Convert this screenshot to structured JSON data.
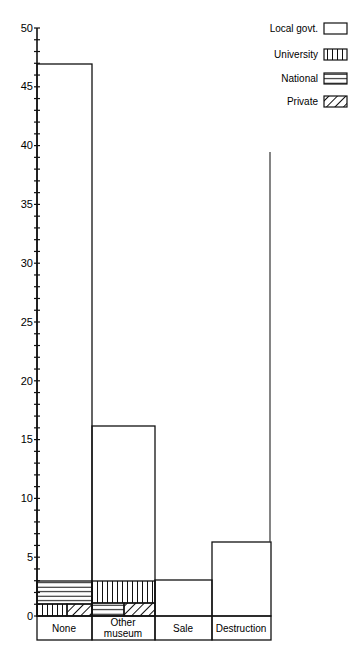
{
  "chart_data": {
    "type": "bar",
    "title": "",
    "xlabel": "",
    "ylabel": "",
    "ylim": [
      0,
      50
    ],
    "yticks": [
      0,
      5,
      10,
      15,
      20,
      25,
      30,
      35,
      40,
      45,
      50
    ],
    "grid": false,
    "legend_position": "top-right",
    "categories": [
      "None",
      "Other museum",
      "Sale",
      "Destruction"
    ],
    "series": [
      {
        "name": "Local govt.",
        "pattern": "blank",
        "values": [
          44,
          13,
          3,
          6
        ]
      },
      {
        "name": "University",
        "pattern": "vertical-lines",
        "values": [
          0.5,
          2,
          0,
          0
        ]
      },
      {
        "name": "National",
        "pattern": "horizontal-lines",
        "values": [
          2,
          0.5,
          0,
          0
        ]
      },
      {
        "name": "Private",
        "pattern": "diagonal-hatch",
        "values": [
          0.5,
          0.5,
          0,
          0
        ]
      }
    ],
    "totals": [
      47,
      16,
      3,
      6
    ]
  },
  "axis": {
    "ticks": [
      "0",
      "5",
      "10",
      "15",
      "20",
      "25",
      "30",
      "35",
      "40",
      "45",
      "50"
    ]
  },
  "categories": {
    "none": "None",
    "other_line1": "Other",
    "other_line2": "museum",
    "sale": "Sale",
    "destruction": "Destruction"
  },
  "legend": {
    "local": "Local govt.",
    "university": "University",
    "national": "National",
    "private": "Private"
  }
}
